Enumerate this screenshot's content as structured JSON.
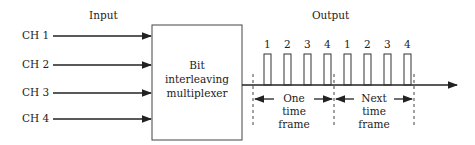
{
  "diagram": {
    "input_label": "Input",
    "output_label": "Output",
    "channels": [
      "CH 1",
      "CH 2",
      "CH 3",
      "CH 4"
    ],
    "multiplexer": {
      "line1": "Bit",
      "line2": "interleaving",
      "line3": "multiplexer"
    },
    "pulse_labels": [
      "1",
      "2",
      "3",
      "4",
      "1",
      "2",
      "3",
      "4"
    ],
    "frames": [
      {
        "line1": "One",
        "line2": "time",
        "line3": "frame"
      },
      {
        "line1": "Next",
        "line2": "time",
        "line3": "frame"
      }
    ],
    "line_color": "#222222"
  }
}
